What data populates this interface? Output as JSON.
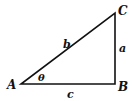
{
  "diagram": {
    "type": "right-triangle",
    "vertices": {
      "A": {
        "label": "A",
        "x": 21,
        "y": 84
      },
      "B": {
        "label": "B",
        "x": 115,
        "y": 84
      },
      "C": {
        "label": "C",
        "x": 115,
        "y": 13
      }
    },
    "sides": {
      "hypotenuse": {
        "label": "b"
      },
      "vertical": {
        "label": "a"
      },
      "base": {
        "label": "c"
      }
    },
    "angle": {
      "label": "θ",
      "at": "A"
    },
    "stroke_color": "#111111"
  }
}
